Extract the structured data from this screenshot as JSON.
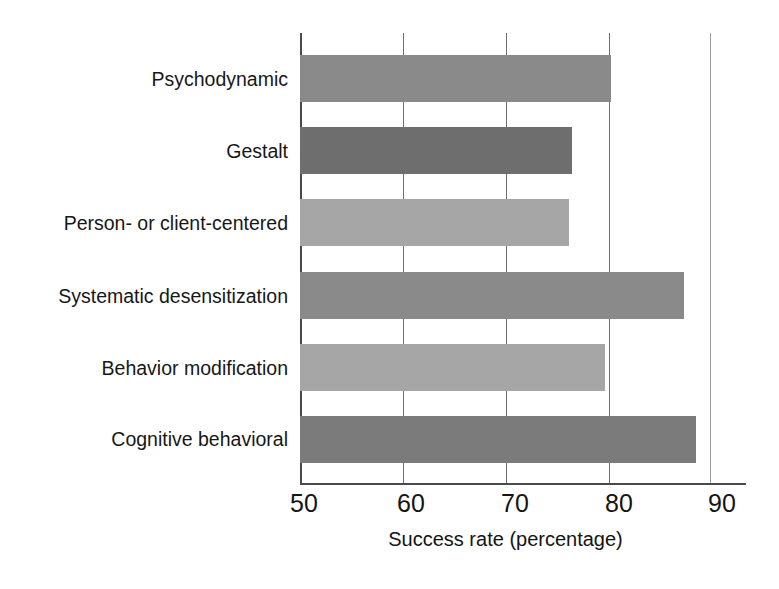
{
  "chart_data": {
    "type": "bar",
    "orientation": "horizontal",
    "title": "",
    "subtitle": "",
    "xlabel": "Success rate (percentage)",
    "ylabel": "",
    "xlim": [
      50,
      90
    ],
    "ylim": null,
    "xticks": [
      50,
      60,
      70,
      80,
      90
    ],
    "xtick_labels": [
      "50",
      "60",
      "70",
      "80",
      "90"
    ],
    "grid": "vertical",
    "legend": "none",
    "categories": [
      "Psychodynamic",
      "Gestalt",
      "Person- or client-centered",
      "Systematic desensitization",
      "Behavior modification",
      "Cognitive behavioral"
    ],
    "values": [
      80.3,
      76.5,
      76.2,
      87.4,
      79.7,
      88.5
    ],
    "bar_colors": [
      "#8a8a8a",
      "#6e6e6e",
      "#a6a6a6",
      "#8a8a8a",
      "#a6a6a6",
      "#7b7b7b"
    ],
    "bars": [
      {
        "label": "Psychodynamic",
        "value": 80.3,
        "color": "#8a8a8a"
      },
      {
        "label": "Gestalt",
        "value": 76.5,
        "color": "#6e6e6e"
      },
      {
        "label": "Person- or client-centered",
        "value": 76.2,
        "color": "#a6a6a6"
      },
      {
        "label": "Systematic desensitization",
        "value": 87.4,
        "color": "#8a8a8a"
      },
      {
        "label": "Behavior modification",
        "value": 79.7,
        "color": "#a6a6a6"
      },
      {
        "label": "Cognitive behavioral",
        "value": 88.5,
        "color": "#7b7b7b"
      }
    ]
  },
  "axis": {
    "x_title": "Success rate (percentage)",
    "ticks": [
      "50",
      "60",
      "70",
      "80",
      "90"
    ]
  },
  "colors": {
    "background": "#ffffff",
    "axis": "#4a4a4a",
    "gridline": "#6e6e6e",
    "text": "#171717"
  }
}
